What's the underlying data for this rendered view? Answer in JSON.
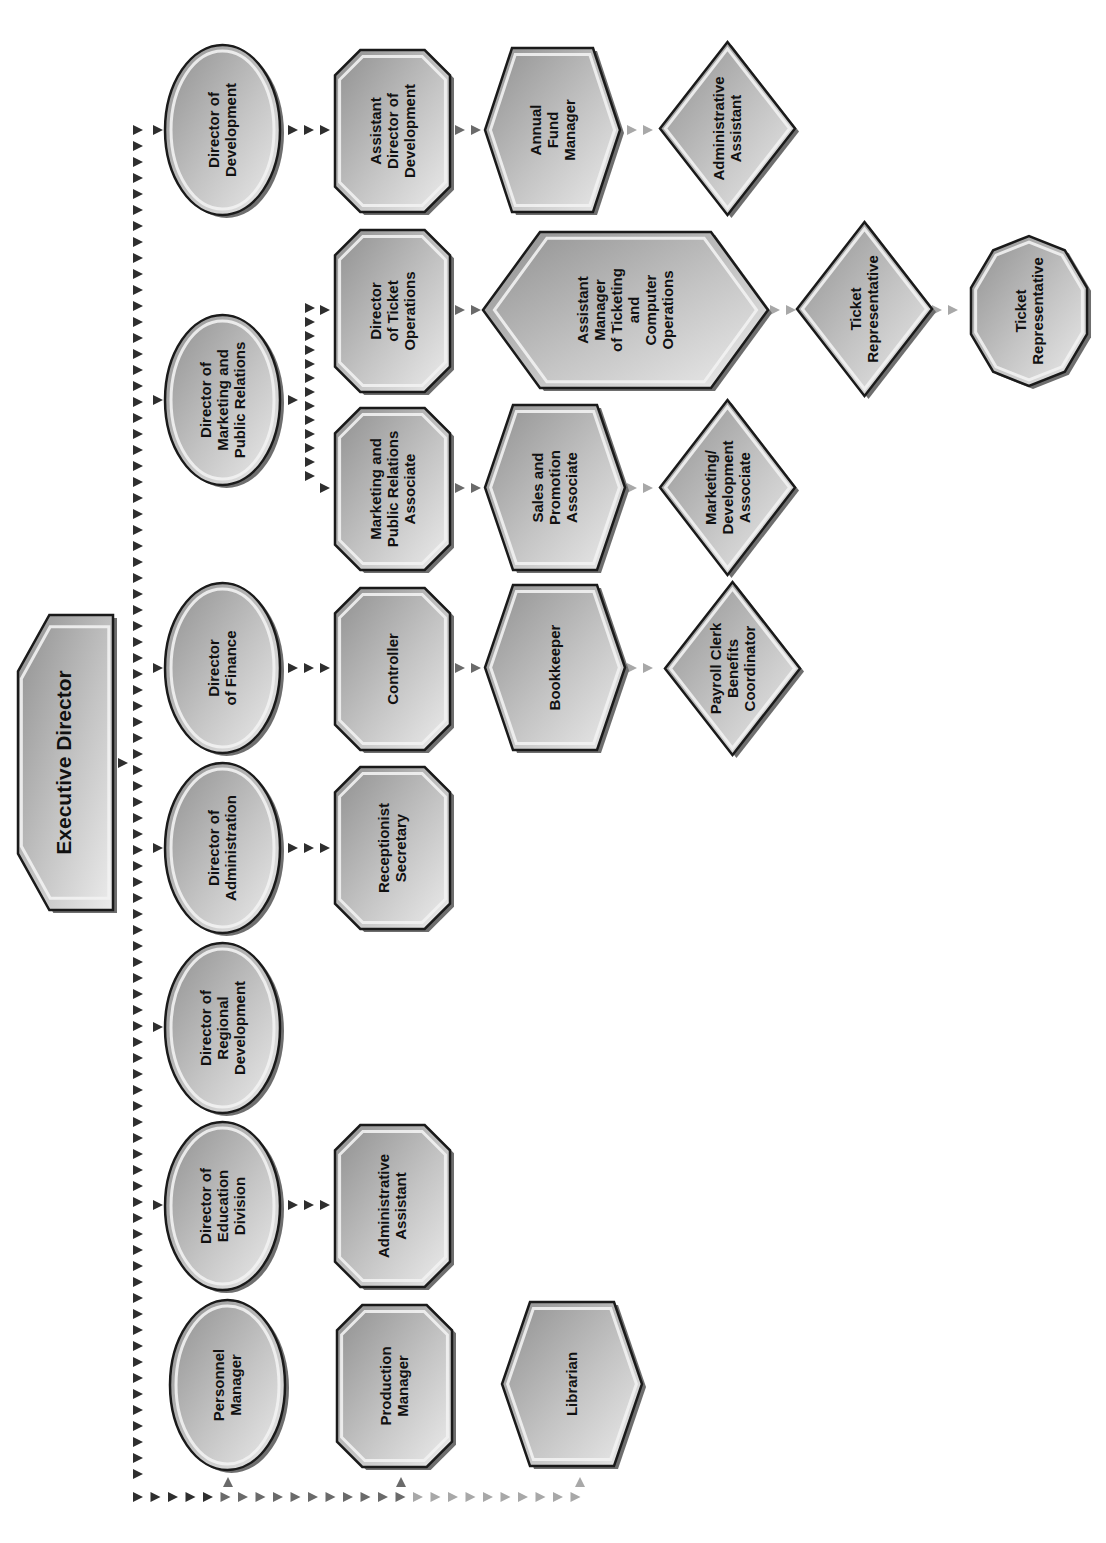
{
  "chart_data": {
    "type": "org-chart",
    "orientation": "rotated-90-ccw",
    "root": "Executive Director",
    "nodes": [
      {
        "id": "exec",
        "label": [
          "Executive Director"
        ],
        "shape": "cut-banner",
        "level": 0
      },
      {
        "id": "dir_dev",
        "label": [
          "Director of",
          "Development"
        ],
        "shape": "ellipse",
        "parent": "exec"
      },
      {
        "id": "dir_mpr",
        "label": [
          "Director of",
          "Marketing and",
          "Public Relations"
        ],
        "shape": "ellipse",
        "parent": "exec"
      },
      {
        "id": "dir_fin",
        "label": [
          "Director",
          "of Finance"
        ],
        "shape": "ellipse",
        "parent": "exec"
      },
      {
        "id": "dir_adm",
        "label": [
          "Director of",
          "Administration"
        ],
        "shape": "ellipse",
        "parent": "exec"
      },
      {
        "id": "dir_reg",
        "label": [
          "Director of",
          "Regional",
          "Development"
        ],
        "shape": "ellipse",
        "parent": "exec"
      },
      {
        "id": "dir_edu",
        "label": [
          "Director of",
          "Education",
          "Division"
        ],
        "shape": "ellipse",
        "parent": "exec"
      },
      {
        "id": "personnel",
        "label": [
          "Personnel",
          "Manager"
        ],
        "shape": "ellipse",
        "parent": "exec"
      },
      {
        "id": "production",
        "label": [
          "Production",
          "Manager"
        ],
        "shape": "octagon",
        "parent": "exec"
      },
      {
        "id": "librarian",
        "label": [
          "Librarian"
        ],
        "shape": "hexagon",
        "parent": "exec"
      },
      {
        "id": "asst_dir_dev",
        "label": [
          "Assistant",
          "Director of",
          "Development"
        ],
        "shape": "octagon",
        "parent": "dir_dev"
      },
      {
        "id": "annual_fund",
        "label": [
          "Annual",
          "Fund",
          "Manager"
        ],
        "shape": "hexagon",
        "parent": "asst_dir_dev"
      },
      {
        "id": "admin_asst_dev",
        "label": [
          "Administrative",
          "Assistant"
        ],
        "shape": "diamond",
        "parent": "annual_fund"
      },
      {
        "id": "dir_ticket",
        "label": [
          "Director",
          "of Ticket",
          "Operations"
        ],
        "shape": "octagon",
        "parent": "dir_mpr"
      },
      {
        "id": "asst_mgr_ticket",
        "label": [
          "Assistant",
          "Manager",
          "of Ticketing",
          "and",
          "Computer",
          "Operations"
        ],
        "shape": "hexagon",
        "parent": "dir_ticket"
      },
      {
        "id": "ticket_rep_1",
        "label": [
          "Ticket",
          "Representative"
        ],
        "shape": "diamond",
        "parent": "asst_mgr_ticket"
      },
      {
        "id": "ticket_rep_2",
        "label": [
          "Ticket",
          "Representative"
        ],
        "shape": "decagon",
        "parent": "ticket_rep_1"
      },
      {
        "id": "mpr_assoc",
        "label": [
          "Marketing and",
          "Public Relations",
          "Associate"
        ],
        "shape": "octagon",
        "parent": "dir_mpr"
      },
      {
        "id": "sales_promo",
        "label": [
          "Sales and",
          "Promotion",
          "Associate"
        ],
        "shape": "hexagon",
        "parent": "mpr_assoc"
      },
      {
        "id": "mkt_dev_assoc",
        "label": [
          "Marketing/",
          "Development",
          "Associate"
        ],
        "shape": "diamond",
        "parent": "sales_promo"
      },
      {
        "id": "controller",
        "label": [
          "Controller"
        ],
        "shape": "octagon",
        "parent": "dir_fin"
      },
      {
        "id": "bookkeeper",
        "label": [
          "Bookkeeper"
        ],
        "shape": "hexagon",
        "parent": "controller"
      },
      {
        "id": "payroll",
        "label": [
          "Payroll Clerk",
          "Benefits",
          "Coordinator"
        ],
        "shape": "diamond",
        "parent": "bookkeeper"
      },
      {
        "id": "receptionist",
        "label": [
          "Receptionist",
          "Secretary"
        ],
        "shape": "octagon",
        "parent": "dir_adm"
      },
      {
        "id": "admin_asst_edu",
        "label": [
          "Administrative",
          "Assistant"
        ],
        "shape": "octagon",
        "parent": "dir_edu"
      }
    ]
  },
  "colors": {
    "shape_fill_dark": "#9a9a9a",
    "shape_fill_light": "#e6e6e6",
    "shape_shadow": "#6e6e6e",
    "outline": "#1a1a1a",
    "arrow_dark": "#2e2e2e",
    "arrow_light": "#a8a8a8",
    "background": "#ffffff"
  },
  "labels": {
    "exec": "Executive Director",
    "dir_dev": [
      "Director of",
      "Development"
    ],
    "dir_mpr": [
      "Director of",
      "Marketing and",
      "Public Relations"
    ],
    "dir_fin": [
      "Director",
      "of Finance"
    ],
    "dir_adm": [
      "Director of",
      "Administration"
    ],
    "dir_reg": [
      "Director of",
      "Regional",
      "Development"
    ],
    "dir_edu": [
      "Director of",
      "Education",
      "Division"
    ],
    "personnel": [
      "Personnel",
      "Manager"
    ],
    "production": [
      "Production",
      "Manager"
    ],
    "librarian": [
      "Librarian"
    ],
    "asst_dir_dev": [
      "Assistant",
      "Director of",
      "Development"
    ],
    "annual_fund": [
      "Annual",
      "Fund",
      "Manager"
    ],
    "admin_asst_dev": [
      "Administrative",
      "Assistant"
    ],
    "dir_ticket": [
      "Director",
      "of Ticket",
      "Operations"
    ],
    "asst_mgr_ticket": [
      "Assistant",
      "Manager",
      "of Ticketing",
      "and",
      "Computer",
      "Operations"
    ],
    "ticket_rep_1": [
      "Ticket",
      "Representative"
    ],
    "ticket_rep_2": [
      "Ticket",
      "Representative"
    ],
    "mpr_assoc": [
      "Marketing and",
      "Public Relations",
      "Associate"
    ],
    "sales_promo": [
      "Sales and",
      "Promotion",
      "Associate"
    ],
    "mkt_dev_assoc": [
      "Marketing/",
      "Development",
      "Associate"
    ],
    "controller": [
      "Controller"
    ],
    "bookkeeper": [
      "Bookkeeper"
    ],
    "payroll": [
      "Payroll Clerk",
      "Benefits",
      "Coordinator"
    ],
    "receptionist": [
      "Receptionist",
      "Secretary"
    ],
    "admin_asst_edu": [
      "Administrative",
      "Assistant"
    ]
  }
}
